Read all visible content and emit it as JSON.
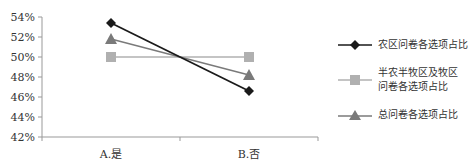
{
  "chart_data": {
    "type": "line",
    "title": "",
    "xlabel": "",
    "ylabel": "",
    "categories": [
      "A.是",
      "B.否"
    ],
    "ylim": [
      0.42,
      0.54
    ],
    "yticks": [
      "42%",
      "44%",
      "46%",
      "48%",
      "50%",
      "52%",
      "54%"
    ],
    "grid": false,
    "legend_position": "right",
    "series": [
      {
        "name": "农区问卷各选项占比",
        "values": [
          0.534,
          0.466
        ],
        "color": "#1a1a1a",
        "marker": "diamond"
      },
      {
        "name": "半农半牧区及牧区问卷各选项占比",
        "values": [
          0.5,
          0.5
        ],
        "color": "#b0b0b0",
        "marker": "square"
      },
      {
        "name": "总问卷各选项占比",
        "values": [
          0.518,
          0.482
        ],
        "color": "#7a7a7a",
        "marker": "triangle"
      }
    ]
  },
  "legend": {
    "items": [
      {
        "label": "农区问卷各选项占比"
      },
      {
        "label_line1": "半农半牧区及牧区",
        "label_line2": "问卷各选项占比"
      },
      {
        "label": "总问卷各选项占比"
      }
    ]
  }
}
